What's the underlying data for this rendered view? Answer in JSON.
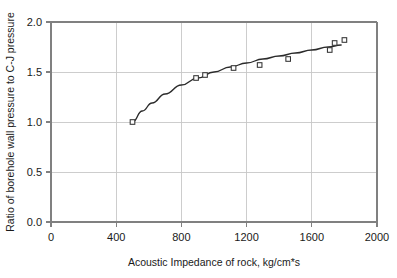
{
  "chart_data": {
    "type": "scatter",
    "title": "",
    "xlabel": "Acoustic Impedance of rock, kg/cm*s",
    "ylabel": "Ratio of borehole wall pressure to C-J pressure",
    "xlim": [
      0,
      2000
    ],
    "ylim": [
      0.0,
      2.0
    ],
    "xticks": [
      0,
      400,
      800,
      1200,
      1600,
      2000
    ],
    "xtick_labels": [
      "0",
      "400",
      "800",
      "1200",
      "1600",
      "2000"
    ],
    "yticks": [
      0.0,
      0.5,
      1.0,
      1.5,
      2.0
    ],
    "ytick_labels": [
      "0.0",
      "0.5",
      "1.0",
      "1.5",
      "2.0"
    ],
    "grid": "horizontal-and-vertical",
    "legend": "none",
    "marker_style": "open-square",
    "series": [
      {
        "name": "measured data",
        "marker": "open-square",
        "points": [
          {
            "x": 500,
            "y": 1.0
          },
          {
            "x": 890,
            "y": 1.44
          },
          {
            "x": 945,
            "y": 1.47
          },
          {
            "x": 1120,
            "y": 1.54
          },
          {
            "x": 1280,
            "y": 1.57
          },
          {
            "x": 1455,
            "y": 1.63
          },
          {
            "x": 1710,
            "y": 1.72
          },
          {
            "x": 1740,
            "y": 1.79
          },
          {
            "x": 1800,
            "y": 1.82
          }
        ]
      },
      {
        "name": "fitted curve",
        "marker": "none",
        "points": [
          {
            "x": 500,
            "y": 1.0
          },
          {
            "x": 560,
            "y": 1.11
          },
          {
            "x": 620,
            "y": 1.19
          },
          {
            "x": 700,
            "y": 1.28
          },
          {
            "x": 800,
            "y": 1.37
          },
          {
            "x": 900,
            "y": 1.44
          },
          {
            "x": 1000,
            "y": 1.5
          },
          {
            "x": 1100,
            "y": 1.55
          },
          {
            "x": 1200,
            "y": 1.59
          },
          {
            "x": 1300,
            "y": 1.63
          },
          {
            "x": 1400,
            "y": 1.66
          },
          {
            "x": 1500,
            "y": 1.69
          },
          {
            "x": 1600,
            "y": 1.72
          },
          {
            "x": 1700,
            "y": 1.75
          },
          {
            "x": 1780,
            "y": 1.77
          }
        ]
      }
    ]
  }
}
